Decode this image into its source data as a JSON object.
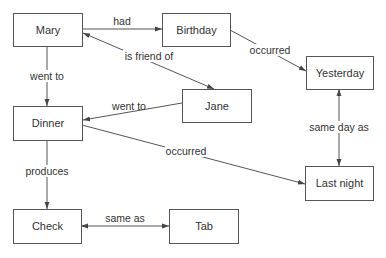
{
  "diagram": {
    "type": "semantic-network",
    "nodes": [
      {
        "id": "mary",
        "label": "Mary",
        "x": 13,
        "y": 13,
        "w": 69,
        "h": 33
      },
      {
        "id": "birthday",
        "label": "Birthday",
        "x": 162,
        "y": 13,
        "w": 68,
        "h": 33
      },
      {
        "id": "yesterday",
        "label": "Yesterday",
        "x": 306,
        "y": 56,
        "w": 67,
        "h": 33
      },
      {
        "id": "jane",
        "label": "Jane",
        "x": 182,
        "y": 89,
        "w": 69,
        "h": 33
      },
      {
        "id": "dinner",
        "label": "Dinner",
        "x": 13,
        "y": 106,
        "w": 69,
        "h": 34
      },
      {
        "id": "lastnight",
        "label": "Last night",
        "x": 305,
        "y": 166,
        "w": 68,
        "h": 34
      },
      {
        "id": "check",
        "label": "Check",
        "x": 13,
        "y": 209,
        "w": 68,
        "h": 34
      },
      {
        "id": "tab",
        "label": "Tab",
        "x": 169,
        "y": 209,
        "w": 69,
        "h": 34
      }
    ],
    "edges": [
      {
        "from": "mary",
        "to": "birthday",
        "label": "had"
      },
      {
        "from": "mary",
        "to": "jane",
        "label": "is friend of",
        "bidirectional": true
      },
      {
        "from": "birthday",
        "to": "yesterday",
        "label": "occurred"
      },
      {
        "from": "mary",
        "to": "dinner",
        "label": "went to"
      },
      {
        "from": "jane",
        "to": "dinner",
        "label": "went to"
      },
      {
        "from": "dinner",
        "to": "lastnight",
        "label": "occurred"
      },
      {
        "from": "yesterday",
        "to": "lastnight",
        "label": "same day as",
        "bidirectional": true
      },
      {
        "from": "dinner",
        "to": "check",
        "label": "produces"
      },
      {
        "from": "check",
        "to": "tab",
        "label": "same as",
        "bidirectional": true
      }
    ]
  },
  "labels": {
    "mary": "Mary",
    "birthday": "Birthday",
    "yesterday": "Yesterday",
    "jane": "Jane",
    "dinner": "Dinner",
    "lastnight": "Last night",
    "check": "Check",
    "tab": "Tab",
    "had": "had",
    "is_friend_of": "is friend of",
    "occurred_1": "occurred",
    "went_to_1": "went to",
    "went_to_2": "went to",
    "occurred_2": "occurred",
    "same_day_as": "same day as",
    "produces": "produces",
    "same_as": "same as"
  }
}
